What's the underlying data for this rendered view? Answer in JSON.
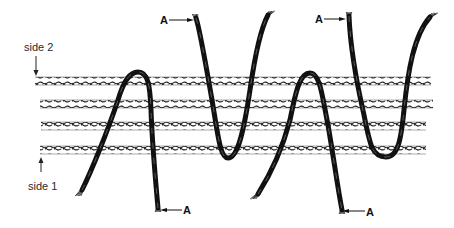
{
  "diagram": {
    "side_labels": {
      "top": "side 2",
      "bottom": "side 1"
    },
    "yarn_end_label": "A",
    "rope_rows": 4,
    "yarn_loops": [
      {
        "name": "loop-1",
        "shape": "inverted-U",
        "end_label": "A",
        "labeled_end": "bottom-right"
      },
      {
        "name": "loop-2",
        "shape": "U",
        "end_label": "A",
        "labeled_end": "top-left"
      },
      {
        "name": "loop-3",
        "shape": "inverted-U",
        "end_label": "A",
        "labeled_end": "bottom-right"
      },
      {
        "name": "loop-4",
        "shape": "U",
        "end_label": "A",
        "labeled_end": "top-left"
      }
    ],
    "colors": {
      "yarn": "#111111",
      "rope": "#222222",
      "background": "#ffffff"
    }
  }
}
